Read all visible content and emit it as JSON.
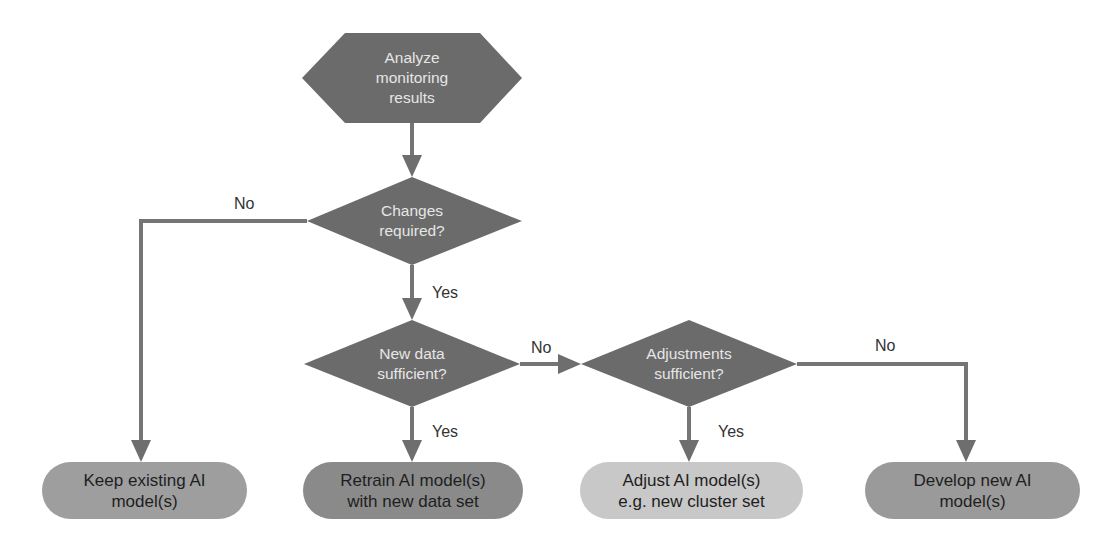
{
  "diagram": {
    "type": "flowchart",
    "colors": {
      "dark_shape": "#6b6b6b",
      "line": "#707070",
      "pill_keep": "#9e9e9e",
      "pill_retrain": "#8a8a8a",
      "pill_adjust": "#c8c8c8",
      "pill_develop": "#9a9a9a"
    },
    "nodes": {
      "start": {
        "shape": "hexagon",
        "lines": [
          "Analyze",
          "monitoring",
          "results"
        ]
      },
      "changes": {
        "shape": "diamond",
        "lines": [
          "Changes",
          "required?"
        ]
      },
      "new_data": {
        "shape": "diamond",
        "lines": [
          "New data",
          "sufficient?"
        ]
      },
      "adjustments": {
        "shape": "diamond",
        "lines": [
          "Adjustments",
          "sufficient?"
        ]
      },
      "keep": {
        "shape": "terminal",
        "lines": [
          "Keep existing AI",
          "model(s)"
        ]
      },
      "retrain": {
        "shape": "terminal",
        "lines": [
          "Retrain AI model(s)",
          "with new data set"
        ]
      },
      "adjust": {
        "shape": "terminal",
        "lines": [
          "Adjust AI model(s)",
          "e.g. new cluster set"
        ]
      },
      "develop": {
        "shape": "terminal",
        "lines": [
          "Develop new AI",
          "model(s)"
        ]
      }
    },
    "edges": [
      {
        "from": "start",
        "to": "changes",
        "label": ""
      },
      {
        "from": "changes",
        "to": "keep",
        "label": "No"
      },
      {
        "from": "changes",
        "to": "new_data",
        "label": "Yes"
      },
      {
        "from": "new_data",
        "to": "adjustments",
        "label": "No"
      },
      {
        "from": "new_data",
        "to": "retrain",
        "label": "Yes"
      },
      {
        "from": "adjustments",
        "to": "adjust",
        "label": "Yes"
      },
      {
        "from": "adjustments",
        "to": "develop",
        "label": "No"
      }
    ]
  }
}
